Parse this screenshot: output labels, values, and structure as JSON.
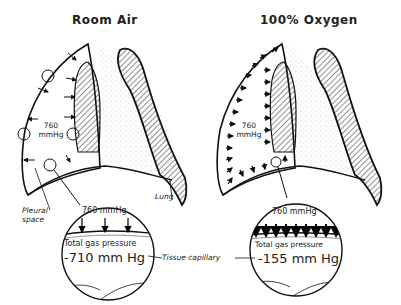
{
  "panels": [
    {
      "title": "Room Air",
      "lung_pressure_value": "760",
      "lung_pressure_unit": "mmHg",
      "inset": {
        "top_label": "760 mmHg",
        "caption": "Total gas pressure",
        "value": "-710 mm Hg"
      }
    },
    {
      "title": "100% Oxygen",
      "lung_pressure_value": "760",
      "lung_pressure_unit": "mmHg",
      "inset": {
        "top_label": "760 mmHg",
        "caption": "Total gas pressure",
        "value": "-155 mm Hg"
      }
    }
  ],
  "annotations": {
    "pleural_space_line1": "Pleural",
    "pleural_space_line2": "space",
    "lung": "Lung",
    "tissue_capillary": "Tissue capillary"
  }
}
